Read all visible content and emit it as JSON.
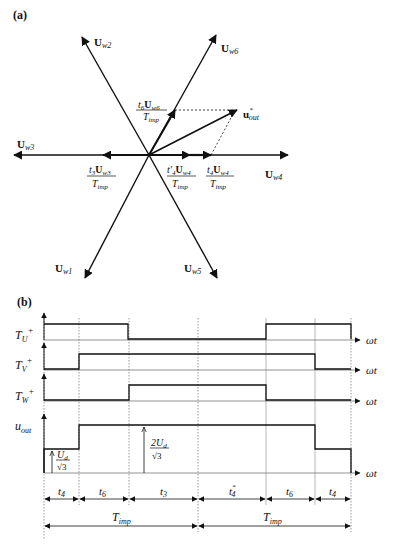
{
  "panel_a": {
    "label": "(a)",
    "vectors": [
      {
        "name": "U",
        "sub": "w1"
      },
      {
        "name": "U",
        "sub": "w2"
      },
      {
        "name": "U",
        "sub": "w3"
      },
      {
        "name": "U",
        "sub": "w4"
      },
      {
        "name": "U",
        "sub": "w5"
      },
      {
        "name": "U",
        "sub": "w6"
      }
    ],
    "output_vector": {
      "name": "u",
      "sub": "out",
      "sup": "*"
    },
    "components": [
      {
        "num_t": "t",
        "num_t_sub": "6",
        "num_vec": "U",
        "num_vec_sub": "w6",
        "den": "T",
        "den_sub": "imp"
      },
      {
        "num_t": "t",
        "num_t_sub": "3",
        "num_vec": "U",
        "num_vec_sub": "w3",
        "den": "T",
        "den_sub": "imp"
      },
      {
        "num_t": "t'",
        "num_t_sub": "4",
        "num_vec": "U",
        "num_vec_sub": "w4",
        "den": "T",
        "den_sub": "imp"
      },
      {
        "num_t": "t",
        "num_t_sub": "4",
        "num_vec": "U",
        "num_vec_sub": "w4",
        "den": "T",
        "den_sub": "imp"
      }
    ]
  },
  "panel_b": {
    "label": "(b)",
    "signals": [
      {
        "name": "T",
        "sub": "U",
        "sup": "+"
      },
      {
        "name": "T",
        "sub": "V",
        "sup": "+"
      },
      {
        "name": "T",
        "sub": "W",
        "sup": "+"
      },
      {
        "name": "u",
        "sub": "out",
        "sup": ""
      }
    ],
    "axis_label": "ωt",
    "levels": {
      "low": {
        "num": "U",
        "num_sub": "d",
        "den": "√3"
      },
      "high": {
        "num": "2U",
        "num_sub": "d",
        "den": "√3"
      }
    },
    "intervals": [
      {
        "t": "t",
        "sub": "4",
        "sup": ""
      },
      {
        "t": "t",
        "sub": "6",
        "sup": ""
      },
      {
        "t": "t",
        "sub": "3",
        "sup": ""
      },
      {
        "t": "t",
        "sub": "4",
        "sup": "*"
      },
      {
        "t": "t",
        "sub": "6",
        "sup": ""
      },
      {
        "t": "t",
        "sub": "4",
        "sup": ""
      }
    ],
    "periods": [
      {
        "t": "T",
        "sub": "imp"
      },
      {
        "t": "T",
        "sub": "imp"
      }
    ]
  }
}
